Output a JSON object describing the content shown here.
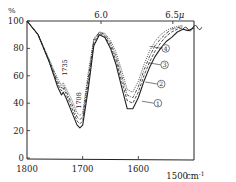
{
  "chart_data": {
    "type": "line",
    "title": "",
    "xlabel": "cm⁻¹",
    "ylabel": "%",
    "x_unit_label": "1500 cm⁻¹",
    "top_axis_label_unit": "μ",
    "xlim": [
      1800,
      1500
    ],
    "ylim": [
      0,
      100
    ],
    "x_ticks": [
      "1800",
      "1700",
      "1600",
      "1500"
    ],
    "y_ticks": [
      "0",
      "20",
      "40",
      "60",
      "80",
      "100"
    ],
    "top_ticks": [
      {
        "label": "6.0",
        "wavenumber": 1667
      },
      {
        "label": "6.5μ",
        "wavenumber": 1538
      }
    ],
    "annotations": [
      {
        "text": "1735",
        "x": 1735,
        "y": 52,
        "orientation": "vertical"
      },
      {
        "text": "1708",
        "x": 1708,
        "y": 36,
        "orientation": "vertical"
      }
    ],
    "grid": false,
    "legend": "inline circled numbers on curves (right side)",
    "series": [
      {
        "name": "①",
        "style": "solid",
        "x": [
          1800,
          1780,
          1760,
          1745,
          1738,
          1735,
          1730,
          1720,
          1710,
          1705,
          1700,
          1690,
          1680,
          1670,
          1660,
          1650,
          1640,
          1630,
          1620,
          1610,
          1600,
          1590,
          1580,
          1570,
          1560,
          1550,
          1540,
          1530,
          1520,
          1510,
          1500
        ],
        "y": [
          100,
          90,
          70,
          52,
          46,
          48,
          44,
          34,
          24,
          22,
          24,
          50,
          82,
          90,
          88,
          80,
          68,
          52,
          36,
          36,
          44,
          56,
          66,
          74,
          80,
          85,
          88,
          92,
          94,
          93,
          95
        ]
      },
      {
        "name": "②",
        "style": "dashed",
        "x": [
          1800,
          1780,
          1760,
          1745,
          1738,
          1735,
          1730,
          1720,
          1710,
          1705,
          1700,
          1690,
          1680,
          1670,
          1660,
          1650,
          1640,
          1630,
          1620,
          1610,
          1600,
          1590,
          1580,
          1570,
          1560,
          1550,
          1540,
          1530,
          1520
        ],
        "y": [
          100,
          90,
          70,
          54,
          49,
          51,
          47,
          37,
          27,
          25,
          27,
          54,
          84,
          91,
          89,
          82,
          71,
          56,
          42,
          40,
          48,
          60,
          70,
          78,
          84,
          89,
          92,
          94,
          95
        ]
      },
      {
        "name": "③",
        "style": "dash-dot",
        "x": [
          1800,
          1780,
          1760,
          1745,
          1738,
          1735,
          1730,
          1720,
          1710,
          1705,
          1700,
          1690,
          1680,
          1670,
          1660,
          1650,
          1640,
          1630,
          1620,
          1610,
          1600,
          1590,
          1580,
          1570,
          1560,
          1550,
          1540,
          1530,
          1520
        ],
        "y": [
          100,
          90,
          71,
          56,
          51,
          53,
          49,
          40,
          30,
          28,
          30,
          58,
          86,
          92,
          90,
          84,
          74,
          60,
          46,
          44,
          52,
          64,
          74,
          82,
          87,
          91,
          94,
          95,
          96
        ]
      },
      {
        "name": "④",
        "style": "dotted",
        "x": [
          1800,
          1780,
          1760,
          1745,
          1738,
          1735,
          1730,
          1720,
          1710,
          1705,
          1700,
          1690,
          1680,
          1670,
          1660,
          1650,
          1640,
          1630,
          1620,
          1610,
          1600,
          1590,
          1580,
          1570,
          1560,
          1550,
          1540,
          1530,
          1520
        ],
        "y": [
          100,
          90,
          72,
          58,
          53,
          55,
          51,
          43,
          33,
          31,
          33,
          62,
          87,
          92,
          91,
          86,
          77,
          64,
          50,
          48,
          56,
          68,
          78,
          85,
          90,
          93,
          95,
          96,
          97
        ]
      }
    ],
    "series_label_positions": [
      {
        "name": "④",
        "x": 1558,
        "y": 80
      },
      {
        "name": "③",
        "x": 1560,
        "y": 68
      },
      {
        "name": "②",
        "x": 1566,
        "y": 54
      },
      {
        "name": "①",
        "x": 1572,
        "y": 40
      }
    ]
  },
  "labels": {
    "y_unit": "%",
    "top_60": "6.0",
    "top_65": "6.5",
    "top_mu": "μ",
    "x_unit": "cm",
    "x_unit_exp": "-1",
    "peak_1735": "1735",
    "peak_1708": "1708"
  }
}
